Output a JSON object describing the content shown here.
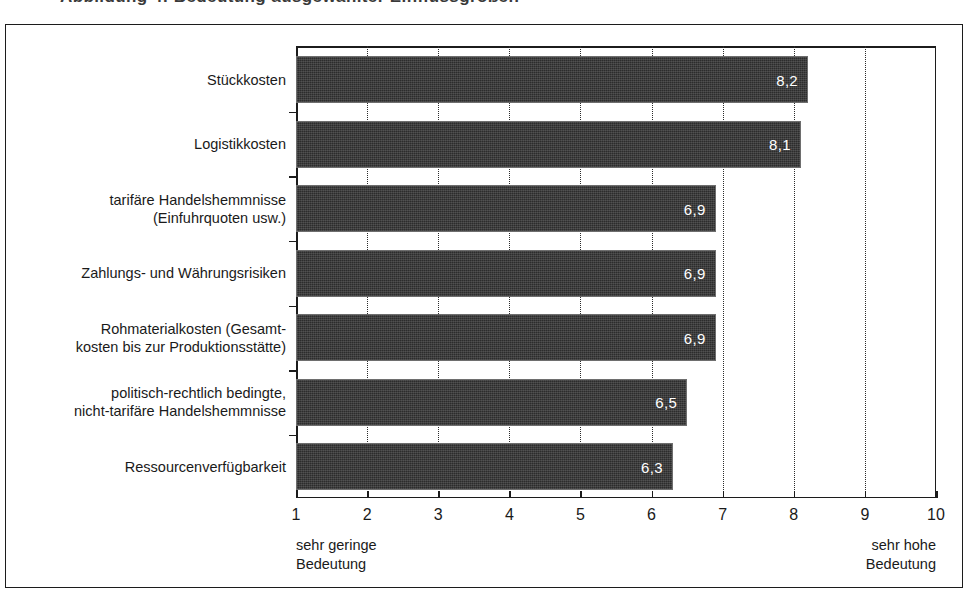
{
  "figure": {
    "cut_off_header_sliver": "Abbildung 4: Bedeutung ausgewählter Einflussgrößen"
  },
  "chart_data": {
    "type": "bar",
    "orientation": "horizontal",
    "title": "",
    "subtitle": "",
    "xlabel": "",
    "ylabel": "",
    "xlim": [
      1,
      10
    ],
    "grid": true,
    "grid_style": "dotted-vertical",
    "legend": "none",
    "value_label_position": "inside-end",
    "bar_color": "#2c2c2c",
    "value_label_color": "#ffffff",
    "categories": [
      "Stückkosten",
      "Logistikkosten",
      "tarifäre Handelshemmnisse\n(Einfuhrquoten usw.)",
      "Zahlungs- und Währungsrisiken",
      "Rohmaterialkosten (Gesamt-\nkosten bis zur Produktionsstätte)",
      "politisch-rechtlich bedingte,\nnicht-tarifäre Handelshemmnisse",
      "Ressourcenverfügbarkeit"
    ],
    "values": [
      8.2,
      8.1,
      6.9,
      6.9,
      6.9,
      6.5,
      6.3
    ],
    "value_labels": [
      "8,2",
      "8,1",
      "6,9",
      "6,9",
      "6,9",
      "6,5",
      "6,3"
    ],
    "xticks": [
      1,
      2,
      3,
      4,
      5,
      6,
      7,
      8,
      9,
      10
    ],
    "xtick_labels": [
      "1",
      "2",
      "3",
      "4",
      "5",
      "6",
      "7",
      "8",
      "9",
      "10"
    ],
    "scale_anchor_low": "sehr geringe\nBedeutung",
    "scale_anchor_high": "sehr hohe\nBedeutung"
  }
}
